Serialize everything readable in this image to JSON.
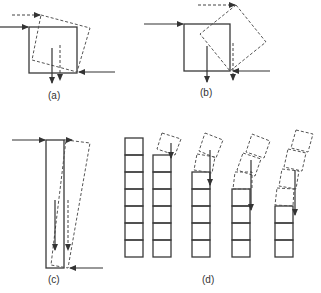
{
  "figure": {
    "panels": [
      {
        "id": "a",
        "label": "(a)"
      },
      {
        "id": "b",
        "label": "(b)"
      },
      {
        "id": "c",
        "label": "(c)"
      },
      {
        "id": "d",
        "label": "(d)"
      }
    ]
  },
  "colors": {
    "stroke": "#3a3a3a",
    "background": "#ffffff"
  }
}
